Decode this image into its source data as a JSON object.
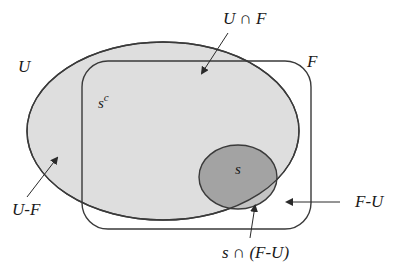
{
  "diagram": {
    "type": "venn",
    "colors": {
      "background": "#ffffff",
      "U_fill": "#dedede",
      "s_fill": "#a3a3a3",
      "s_outside_U_fill": "#c4c4c4",
      "stroke": "#3a3a3a",
      "arrow": "#2a2a2a"
    },
    "sets": [
      {
        "id": "U",
        "shape": "ellipse",
        "label": "U"
      },
      {
        "id": "F",
        "shape": "rounded-rectangle",
        "label": "F"
      },
      {
        "id": "s",
        "shape": "ellipse",
        "label": "s"
      }
    ],
    "labels": {
      "U": "U",
      "F": "F",
      "s": "s",
      "s_complement_base": "s",
      "s_complement_sup": "c",
      "U_intersect_F": "U ∩ F",
      "U_minus_F": "U-F",
      "F_minus_U": "F-U",
      "s_intersect_F_minus_U": "s ∩ (F-U)"
    },
    "annotations": [
      {
        "text": "U ∩ F",
        "points_to": "region inside both U and F"
      },
      {
        "text": "U-F",
        "points_to": "region of U outside F"
      },
      {
        "text": "F-U",
        "points_to": "region of F outside U"
      },
      {
        "text": "s ∩ (F-U)",
        "points_to": "part of s outside U"
      }
    ]
  }
}
